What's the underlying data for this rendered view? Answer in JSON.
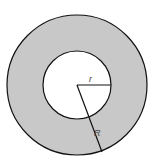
{
  "diagram": {
    "type": "annulus",
    "colors": {
      "ring_fill": "#c8c8c8",
      "inner_fill": "#ffffff",
      "stroke": "#111111"
    },
    "labels": {
      "inner_radius": "r",
      "outer_radius": "R"
    }
  }
}
